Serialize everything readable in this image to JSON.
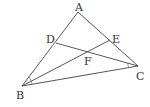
{
  "diagram": {
    "type": "geometry-triangle",
    "points": {
      "A": {
        "label": "A",
        "x": 78,
        "y": 12
      },
      "B": {
        "label": "B",
        "x": 22,
        "y": 86
      },
      "C": {
        "label": "C",
        "x": 138,
        "y": 66
      },
      "D": {
        "label": "D",
        "x": 56,
        "y": 43
      },
      "E": {
        "label": "E",
        "x": 110,
        "y": 40
      },
      "F": {
        "label": "F",
        "x": 87,
        "y": 52
      }
    },
    "segments": [
      "AB",
      "AC",
      "BC",
      "BE",
      "CD"
    ],
    "angle_marks": [
      "ABE = EBC",
      "ACD = DCB"
    ]
  }
}
